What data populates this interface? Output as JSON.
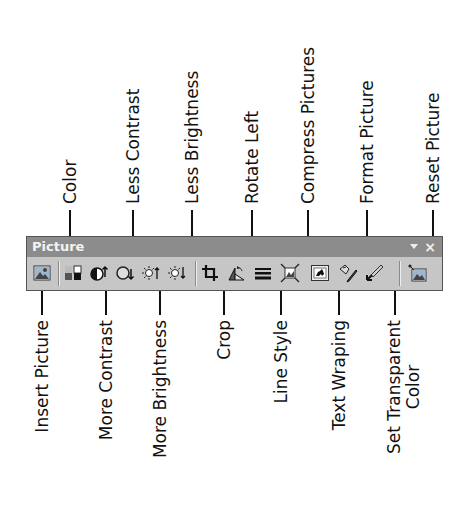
{
  "toolbar": {
    "title": "Picture",
    "menu_icon": "dropdown-arrow-icon",
    "close_icon": "close-icon",
    "close_glyph": "×",
    "background": "#c6c6c6",
    "titlebar_color": "#8c8c8c"
  },
  "buttons": [
    {
      "id": "insert-picture",
      "label": "Insert Picture",
      "icon": "insert-picture-icon",
      "x": 14,
      "side": "bottom"
    },
    {
      "id": "color",
      "label": "Color",
      "icon": "color-icon",
      "x": 44,
      "side": "top"
    },
    {
      "id": "more-contrast",
      "label": "More Contrast",
      "icon": "more-contrast-icon",
      "x": 80,
      "side": "bottom"
    },
    {
      "id": "less-contrast",
      "label": "Less Contrast",
      "icon": "less-contrast-icon",
      "x": 107,
      "side": "top"
    },
    {
      "id": "more-brightness",
      "label": "More Brightness",
      "icon": "more-brightness-icon",
      "x": 134,
      "side": "bottom"
    },
    {
      "id": "less-brightness",
      "label": "Less Brightness",
      "icon": "less-brightness-icon",
      "x": 165,
      "side": "top"
    },
    {
      "id": "crop",
      "label": "Crop",
      "icon": "crop-icon",
      "x": 198,
      "side": "bottom"
    },
    {
      "id": "rotate-left",
      "label": "Rotate Left",
      "icon": "rotate-left-icon",
      "x": 226,
      "side": "top"
    },
    {
      "id": "line-style",
      "label": "Line Style",
      "icon": "line-style-icon",
      "x": 255,
      "side": "bottom"
    },
    {
      "id": "compress-pictures",
      "label": "Compress Pictures",
      "icon": "compress-pictures-icon",
      "x": 282,
      "side": "top"
    },
    {
      "id": "text-wrapping",
      "label": "Text Wraping",
      "icon": "text-wrapping-icon",
      "x": 313,
      "side": "bottom"
    },
    {
      "id": "format-picture",
      "label": "Format Picture",
      "icon": "format-picture-icon",
      "x": 341,
      "side": "top"
    },
    {
      "id": "set-transparent-color",
      "label": "Set Transparent",
      "label_line2": "Color",
      "icon": "set-transparent-color-icon",
      "x": 369,
      "side": "bottom"
    },
    {
      "id": "reset-picture",
      "label": "Reset Picture",
      "icon": "reset-picture-icon",
      "x": 407,
      "side": "top"
    }
  ],
  "callouts_top": [
    {
      "label": "Color",
      "x": 70
    },
    {
      "label": "Less Contrast",
      "x": 133
    },
    {
      "label": "Less Brightness",
      "x": 192
    },
    {
      "label": "Rotate Left",
      "x": 252
    },
    {
      "label": "Compress Pictures",
      "x": 308
    },
    {
      "label": "Format Picture",
      "x": 367
    },
    {
      "label": "Reset Picture",
      "x": 433
    }
  ],
  "callouts_bottom": [
    {
      "label": "Insert Picture",
      "x": 42
    },
    {
      "label": "More Contrast",
      "x": 106
    },
    {
      "label": "More Brightness",
      "x": 160
    },
    {
      "label": "Crop",
      "x": 224
    },
    {
      "label": "Line Style",
      "x": 281
    },
    {
      "label": "Text Wraping",
      "x": 339
    },
    {
      "label": "Set Transparent",
      "label_line2": "Color",
      "x": 395
    }
  ]
}
